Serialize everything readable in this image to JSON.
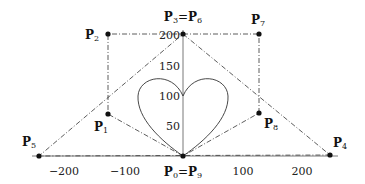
{
  "diagram": {
    "type": "bezier-control-polygon-heart",
    "axes": {
      "x_ticks": [
        "−200",
        "−100",
        "100",
        "200"
      ],
      "y_ticks": [
        "50",
        "100",
        "150",
        "200"
      ]
    },
    "points": [
      {
        "id": "P0",
        "label": "P",
        "sub": "0",
        "x": 0,
        "y": 0
      },
      {
        "id": "P1",
        "label": "P",
        "sub": "1",
        "x": -125,
        "y": 70
      },
      {
        "id": "P2",
        "label": "P",
        "sub": "2",
        "x": -125,
        "y": 200
      },
      {
        "id": "P3",
        "label": "P",
        "sub": "3",
        "x": 0,
        "y": 200
      },
      {
        "id": "P4",
        "label": "P",
        "sub": "4",
        "x": 250,
        "y": 0
      },
      {
        "id": "P5",
        "label": "P",
        "sub": "5",
        "x": -250,
        "y": 0
      },
      {
        "id": "P6",
        "label": "P",
        "sub": "6",
        "x": 0,
        "y": 200
      },
      {
        "id": "P7",
        "label": "P",
        "sub": "7",
        "x": 125,
        "y": 200
      },
      {
        "id": "P8",
        "label": "P",
        "sub": "8",
        "x": 125,
        "y": 70
      },
      {
        "id": "P9",
        "label": "P",
        "sub": "9",
        "x": 0,
        "y": 0
      }
    ],
    "labels": {
      "p0_p9": {
        "a": "P",
        "a_sub": "0",
        "eq": "=",
        "b": "P",
        "b_sub": "9"
      },
      "p3_p6": {
        "a": "P",
        "a_sub": "3",
        "eq": "=",
        "b": "P",
        "b_sub": "6"
      },
      "p1": {
        "a": "P",
        "a_sub": "1"
      },
      "p2": {
        "a": "P",
        "a_sub": "2"
      },
      "p4": {
        "a": "P",
        "a_sub": "4"
      },
      "p5": {
        "a": "P",
        "a_sub": "5"
      },
      "p7": {
        "a": "P",
        "a_sub": "7"
      },
      "p8": {
        "a": "P",
        "a_sub": "8"
      }
    },
    "curve": "heart shape formed by Bezier curve, cusp at (0,100), bottom tip at (0,0)"
  }
}
